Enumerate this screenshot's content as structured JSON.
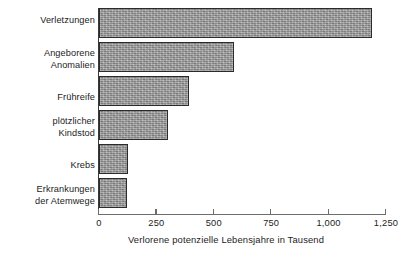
{
  "chart_data": {
    "type": "bar",
    "orientation": "horizontal",
    "title": "",
    "xlabel": "Verlorene potenzielle Lebensjahre in Tausend",
    "ylabel": "",
    "xlim": [
      0,
      1250
    ],
    "xticks": [
      0,
      250,
      500,
      750,
      1000,
      1250
    ],
    "xtick_labels": [
      "0",
      "250",
      "500",
      "750",
      "1,000",
      "1,250"
    ],
    "grid": false,
    "legend": false,
    "categories": [
      "Verletzungen",
      "Angeborene\nAnomalien",
      "Frühreife",
      "plötzlicher\nKindstod",
      "Krebs",
      "Erkrankungen\nder Atemwege"
    ],
    "values": [
      1190,
      590,
      390,
      300,
      125,
      120
    ],
    "bar_color": "#9c9c9c",
    "bar_border_color": "#2b2b2b",
    "axis_color": "#6d6d6d"
  }
}
